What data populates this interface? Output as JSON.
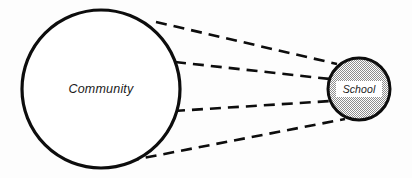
{
  "diagram": {
    "background_color": "#fdfdfd",
    "stroke_color": "#0d0d0d",
    "nodes": [
      {
        "id": "community",
        "label": "Community",
        "shape": "circle",
        "fill": "#ffffff",
        "fill_pattern": "none",
        "stroke_color": "#0d0d0d",
        "stroke_width": 3.2,
        "cx": 101,
        "cy": 89,
        "r": 79
      },
      {
        "id": "school",
        "label": "School",
        "shape": "circle",
        "fill": "#c9c9c9",
        "fill_pattern": "stipple-checker",
        "label_box_fill": "#ffffff",
        "stroke_color": "#0d0d0d",
        "stroke_width": 3.0,
        "cx": 359,
        "cy": 89,
        "r": 32
      }
    ],
    "connectors": [
      {
        "id": "connector-1",
        "from": "community",
        "to": "school",
        "style": "dashed",
        "stroke_width": 2.6,
        "dash_pattern": "11 7",
        "x1": 156,
        "y1": 22,
        "x2": 337,
        "y2": 64
      },
      {
        "id": "connector-2",
        "from": "community",
        "to": "school",
        "style": "dashed",
        "stroke_width": 2.6,
        "dash_pattern": "11 7",
        "x1": 175,
        "y1": 62,
        "x2": 330,
        "y2": 79
      },
      {
        "id": "connector-3",
        "from": "community",
        "to": "school",
        "style": "dashed",
        "stroke_width": 2.6,
        "dash_pattern": "11 7",
        "x1": 174,
        "y1": 111,
        "x2": 331,
        "y2": 101
      },
      {
        "id": "connector-4",
        "from": "community",
        "to": "school",
        "style": "dashed",
        "stroke_width": 2.6,
        "dash_pattern": "11 7",
        "x1": 128,
        "y1": 161,
        "x2": 345,
        "y2": 119
      }
    ]
  }
}
